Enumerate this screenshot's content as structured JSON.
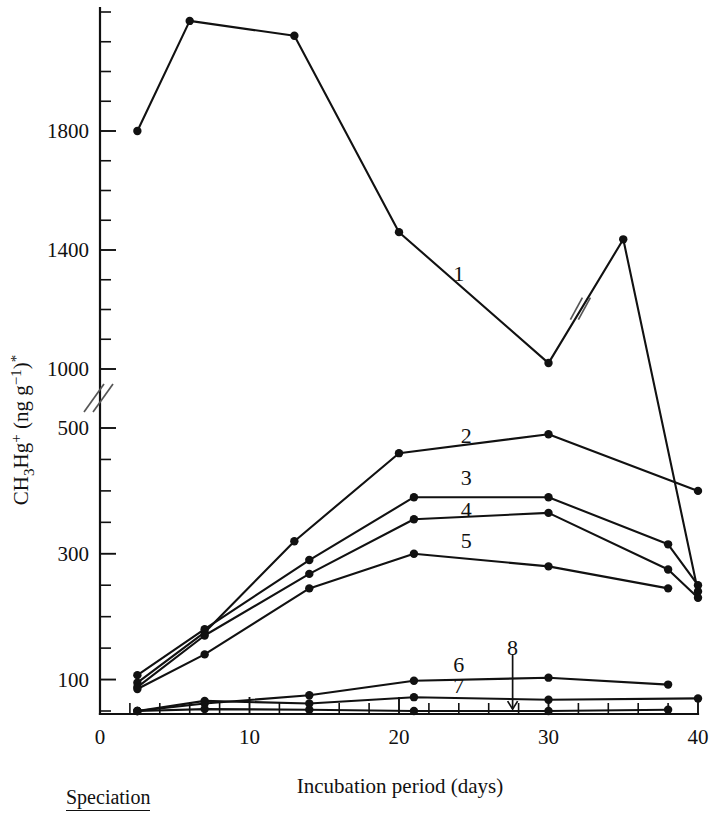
{
  "chart_data": {
    "type": "line",
    "title": "",
    "xlabel": "Incubation period (days)",
    "ylabel": "CH3Hg+ (ng g-1)*",
    "ylabel_parts": {
      "species": "CH",
      "sub3": "3",
      "hg": "Hg",
      "charge": "+",
      "open": " (ng g",
      "exp": "−1",
      "close": ")",
      "star": "*"
    },
    "xlim": [
      0,
      40
    ],
    "xticks_major": [
      0,
      10,
      20,
      30,
      40
    ],
    "xtick_labels": [
      "0",
      "10",
      "20",
      "30",
      "40"
    ],
    "xtick_minor_step": 2,
    "y_axis_broken": true,
    "y_break_between": [
      500,
      1000
    ],
    "yticks_lower": [
      50,
      100,
      150,
      200,
      250,
      300,
      350,
      400,
      450,
      500
    ],
    "ytick_labels_lower": [
      "100",
      "300",
      "500"
    ],
    "ytick_labels_lower_values": [
      100,
      300,
      500
    ],
    "yticks_upper": [
      1000,
      1100,
      1200,
      1300,
      1400,
      1500,
      1600,
      1700,
      1800,
      1900,
      2000,
      2100,
      2200
    ],
    "ytick_labels_upper": [
      "1000",
      "1400",
      "1800"
    ],
    "ytick_labels_upper_values": [
      1000,
      1400,
      1800
    ],
    "grid": false,
    "legend_position": "inline-labels",
    "series": [
      {
        "name": "1",
        "label": "1",
        "label_point": {
          "x": 24.0,
          "y": 1320
        },
        "has_break_marker": true,
        "break_marker_x": 32.2,
        "x": [
          2.5,
          6,
          13,
          20,
          30,
          35,
          40
        ],
        "y": [
          1800,
          2170,
          2120,
          1460,
          1020,
          800,
          240
        ]
      },
      {
        "name": "2",
        "label": "2",
        "label_point": {
          "x": 24.5,
          "y": 488
        },
        "x": [
          2.5,
          7,
          13,
          20,
          30,
          40
        ],
        "y": [
          95,
          175,
          320,
          460,
          490,
          400
        ]
      },
      {
        "name": "3",
        "label": "3",
        "label_point": {
          "x": 24.5,
          "y": 420
        },
        "x": [
          2.5,
          7,
          14,
          21,
          30,
          38,
          40
        ],
        "y": [
          107,
          180,
          290,
          390,
          390,
          315,
          250
        ]
      },
      {
        "name": "4",
        "label": "4",
        "label_point": {
          "x": 24.5,
          "y": 370
        },
        "x": [
          2.5,
          7,
          14,
          21,
          30,
          38,
          40
        ],
        "y": [
          88,
          170,
          268,
          355,
          365,
          275,
          230
        ]
      },
      {
        "name": "5",
        "label": "5",
        "label_point": {
          "x": 24.5,
          "y": 320
        },
        "x": [
          2.5,
          7,
          14,
          21,
          30,
          38
        ],
        "y": [
          85,
          140,
          245,
          300,
          280,
          245
        ]
      },
      {
        "name": "6",
        "label": "6",
        "label_point": {
          "x": 24.0,
          "y": 123
        },
        "x": [
          2.5,
          7,
          14,
          21,
          30,
          38
        ],
        "y": [
          50,
          62,
          75,
          98,
          103,
          92
        ]
      },
      {
        "name": "7",
        "label": "7",
        "label_point": {
          "x": 24.0,
          "y": 90
        },
        "x": [
          2.5,
          7,
          14,
          21,
          30,
          40
        ],
        "y": [
          50,
          66,
          62,
          72,
          68,
          70
        ]
      },
      {
        "name": "8",
        "label": "8",
        "label_point": {
          "x": 27.6,
          "y": 150
        },
        "has_arrow": true,
        "arrow_from": {
          "x": 27.6,
          "y": 140
        },
        "arrow_to": {
          "x": 27.6,
          "y": 53
        },
        "x": [
          2.5,
          7,
          14,
          21,
          30,
          38
        ],
        "y": [
          50,
          53,
          52,
          50,
          50,
          52
        ]
      }
    ]
  },
  "caption": {
    "text": "Speciation"
  },
  "colors": {
    "ink": "#111111",
    "break": "#555555",
    "background": "#ffffff"
  }
}
